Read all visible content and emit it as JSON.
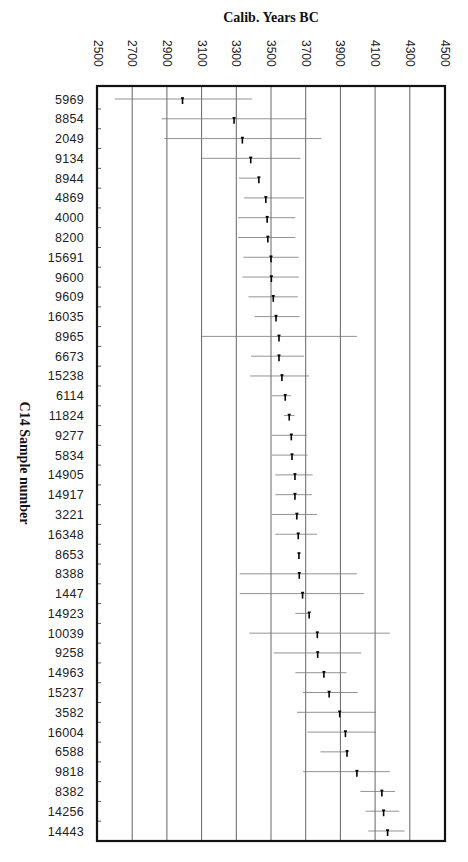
{
  "chart_data": {
    "type": "scatter",
    "subtype": "range-plot (calibrated date ranges with median marker)",
    "title": "Calib. Years BC",
    "xlabel": "Calib. Years BC",
    "ylabel": "C14 Sample number",
    "x_ticks": [
      2500,
      2700,
      2900,
      3100,
      3300,
      3500,
      3700,
      3900,
      4100,
      4300,
      4500
    ],
    "xlim": [
      2500,
      4500
    ],
    "x_tick_label_rotation": 90,
    "x_axis_position": "top",
    "grid": "vertical lines at each x tick",
    "legend": "none",
    "categories": [
      "5969",
      "8854",
      "2049",
      "9134",
      "8944",
      "4869",
      "4000",
      "8200",
      "15691",
      "9600",
      "9609",
      "16035",
      "8965",
      "6673",
      "15238",
      "6114",
      "11824",
      "9277",
      "5834",
      "14905",
      "14917",
      "3221",
      "16348",
      "8653",
      "8388",
      "1447",
      "14923",
      "10039",
      "9258",
      "14963",
      "15237",
      "3582",
      "16004",
      "6588",
      "9818",
      "8382",
      "14256",
      "14443"
    ],
    "series": [
      {
        "name": "range_start_BC",
        "values": [
          2600,
          2870,
          2885,
          3100,
          3315,
          3345,
          3310,
          3310,
          3340,
          3335,
          3370,
          3405,
          3100,
          3385,
          3380,
          3505,
          3575,
          3505,
          3505,
          3525,
          3525,
          3505,
          3525,
          3660,
          3320,
          3320,
          3640,
          3375,
          3515,
          3640,
          3685,
          3650,
          3710,
          3785,
          3685,
          4015,
          4045,
          4060
        ]
      },
      {
        "name": "median_BC",
        "values": [
          2990,
          3287,
          3335,
          3383,
          3430,
          3470,
          3478,
          3482,
          3500,
          3502,
          3513,
          3529,
          3546,
          3546,
          3563,
          3582,
          3605,
          3617,
          3621,
          3638,
          3638,
          3649,
          3657,
          3661,
          3663,
          3682,
          3720,
          3767,
          3769,
          3805,
          3835,
          3896,
          3929,
          3938,
          3995,
          4139,
          4149,
          4172
        ]
      },
      {
        "name": "range_end_BC",
        "values": [
          3390,
          3705,
          3790,
          3670,
          3430,
          3690,
          3640,
          3640,
          3660,
          3660,
          3655,
          3665,
          3995,
          3690,
          3720,
          3615,
          3635,
          3705,
          3710,
          3740,
          3735,
          3765,
          3765,
          3661,
          3995,
          4035,
          3725,
          4185,
          4020,
          3935,
          4000,
          4105,
          4105,
          3950,
          4185,
          4215,
          4240,
          4270
        ]
      }
    ]
  }
}
